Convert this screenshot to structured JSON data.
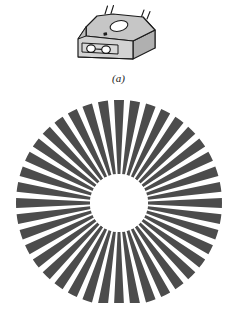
{
  "figure": {
    "background_color": "#ffffff",
    "width": 237,
    "height": 331,
    "panels": [
      {
        "id": "a",
        "caption": "(a)",
        "subject": "optical-interrupter-sensor-module",
        "description": "Three-dimensional perspective drawing of a slotted optical sensor package with leads"
      },
      {
        "id": "b",
        "caption": "(b)",
        "subject": "radial-slotted-encoder-disk",
        "description": "Top view of a circular encoder disk with radial opaque spokes and a clear central hub"
      }
    ]
  },
  "panel_a": {
    "caption": "(a)",
    "colors": {
      "top_face": "#c6c6c6",
      "front_face": "#d2d2d2",
      "side_face": "#9d9d9d",
      "outline": "#1a1a1a",
      "detail_dark": "#2a2a2a",
      "lead": "#1a1a1a"
    },
    "parts": [
      {
        "name": "housing-top-face",
        "label": "top face"
      },
      {
        "name": "housing-front-face",
        "label": "front face"
      },
      {
        "name": "housing-right-face",
        "label": "right side face"
      },
      {
        "name": "top-oval-aperture",
        "label": "oval aperture"
      },
      {
        "name": "top-pin-dot",
        "label": "index dot"
      },
      {
        "name": "front-lens-left",
        "label": "emitter lens"
      },
      {
        "name": "front-lens-right",
        "label": "detector lens"
      }
    ],
    "lead_count": 4
  },
  "panel_b": {
    "caption": "(b)",
    "colors": {
      "spoke": "#4c4c4c",
      "gap": "#ffffff",
      "hub": "#ffffff"
    },
    "geometry": {
      "center_x": 119,
      "center_y": 203,
      "outer_radius": 103,
      "inner_radius": 29,
      "spoke_count": 40,
      "duty_cycle_percent": 62
    }
  },
  "chart_data": {
    "type": "pie",
    "title": "",
    "subtitle": "",
    "xlabel": "",
    "ylabel": "",
    "legend_position": "none",
    "grid": false,
    "categories": [
      "opaque spoke",
      "transparent gap"
    ],
    "values": [
      62,
      38
    ],
    "series": [
      {
        "name": "sector angular share (percent of pitch)",
        "values": [
          62,
          38
        ]
      }
    ],
    "annotations": [
      "(a)",
      "(b)"
    ]
  }
}
